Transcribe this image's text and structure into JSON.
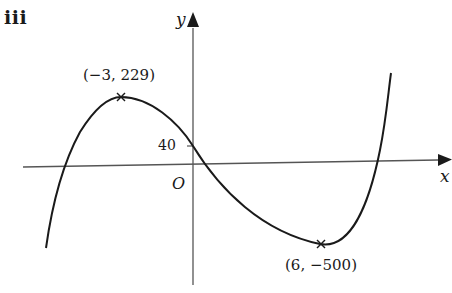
{
  "part_label": "iii",
  "axes": {
    "x_label": "x",
    "y_label": "y",
    "origin_label": "O"
  },
  "y_intercept": {
    "label": "40",
    "value": 40
  },
  "turning_points": [
    {
      "label": "(−3, 229)",
      "x": -3,
      "y": 229,
      "type": "maximum",
      "marker": "cross"
    },
    {
      "label": "(6, −500)",
      "x": 6,
      "y": -500,
      "type": "minimum",
      "marker": "cross"
    }
  ],
  "curve": {
    "description": "cubic curve with positive leading coefficient",
    "color": "#1a1a1a"
  }
}
